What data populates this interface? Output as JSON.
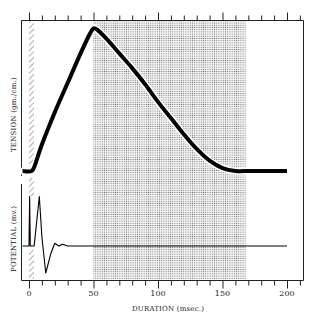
{
  "chart_data": {
    "type": "line",
    "title": "",
    "xlabel": "DURATION (msec.)",
    "xlim": [
      0,
      200
    ],
    "xticks": [
      0,
      50,
      100,
      150,
      200
    ],
    "x_minor_tick_step": 10,
    "shaded_regions": [
      {
        "type": "hatched",
        "x_start": 0,
        "x_end": 4,
        "meaning": "stimulus"
      },
      {
        "type": "stippled",
        "x_start": 50,
        "x_end": 168
      }
    ],
    "panels": [
      {
        "name": "tension",
        "ylabel": "TENSION (gm./cm.)",
        "series": [
          {
            "name": "Tension",
            "x": [
              -5,
              2,
              5,
              10,
              20,
              30,
              40,
              47,
              50,
              53,
              60,
              70,
              80,
              90,
              100,
              110,
              120,
              130,
              140,
              150,
              160,
              170,
              180,
              190,
              200
            ],
            "y": [
              0,
              0,
              5,
              18,
              40,
              60,
              80,
              93,
              97,
              96,
              90,
              80,
              70,
              59,
              47,
              36,
              25,
              15,
              7,
              2,
              0,
              0,
              0,
              0,
              0
            ],
            "units": "relative (0-100)"
          }
        ]
      },
      {
        "name": "potential",
        "ylabel": "POTENTIAL (mv.)",
        "series": [
          {
            "name": "Potential",
            "x": [
              -5,
              0,
              0.5,
              1,
              4,
              8,
              10,
              13,
              17,
              20,
              23,
              26,
              30,
              200
            ],
            "y": [
              0,
              0,
              55,
              0,
              0,
              55,
              10,
              -30,
              -8,
              3,
              0,
              2,
              0,
              0
            ],
            "units": "relative"
          }
        ]
      }
    ]
  },
  "labels": {
    "y_top": "TENSION (gm./cm.)",
    "y_bottom": "POTENTIAL (mv.)",
    "x": "DURATION (msec.)",
    "ticks": [
      "0",
      "50",
      "100",
      "150",
      "200"
    ]
  }
}
